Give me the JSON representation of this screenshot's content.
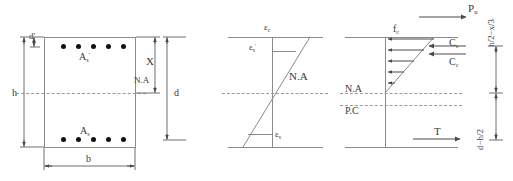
{
  "figure": {
    "title_semantic": "reinforced-concrete-section-strain-stress-diagram",
    "panels": [
      "cross-section",
      "strain-distribution",
      "stress-and-force-distribution"
    ]
  },
  "section": {
    "label_h": "h",
    "label_b": "b",
    "label_d": "d",
    "label_d_prime": "d'",
    "label_x": "X",
    "label_na": "N.A",
    "label_as_top": "A",
    "label_as_top_sub": "s",
    "label_as_top_prime": "'",
    "label_as_bottom": "A",
    "label_as_bottom_sub": "s",
    "top_bar_count": 5,
    "bottom_bar_count": 5
  },
  "strain": {
    "label_ec": "ε",
    "label_ec_sub": "c",
    "label_es_prime": "ε",
    "label_es_prime_sub": "s",
    "label_es_prime_sup": "'",
    "label_es": "ε",
    "label_es_sub": "s",
    "label_na": "N.A"
  },
  "stress": {
    "label_pu": "P",
    "label_pu_sub": "u",
    "label_fc": "f",
    "label_fc_sub": "c",
    "label_cs": "C",
    "label_cs_sub": "s",
    "label_cc": "C",
    "label_cc_sub": "c",
    "label_t": "T",
    "label_na": "N.A",
    "label_pc": "P.C",
    "arrow_count": 5
  },
  "dimensions": {
    "lever_upper": "h/2−x/3",
    "lever_lower": "d−h/2"
  },
  "colors": {
    "line": "#8a8a8a",
    "arrow": "#4a4a4a",
    "text": "#3a3a3a",
    "rebar": "#111111",
    "background": "#ffffff"
  }
}
